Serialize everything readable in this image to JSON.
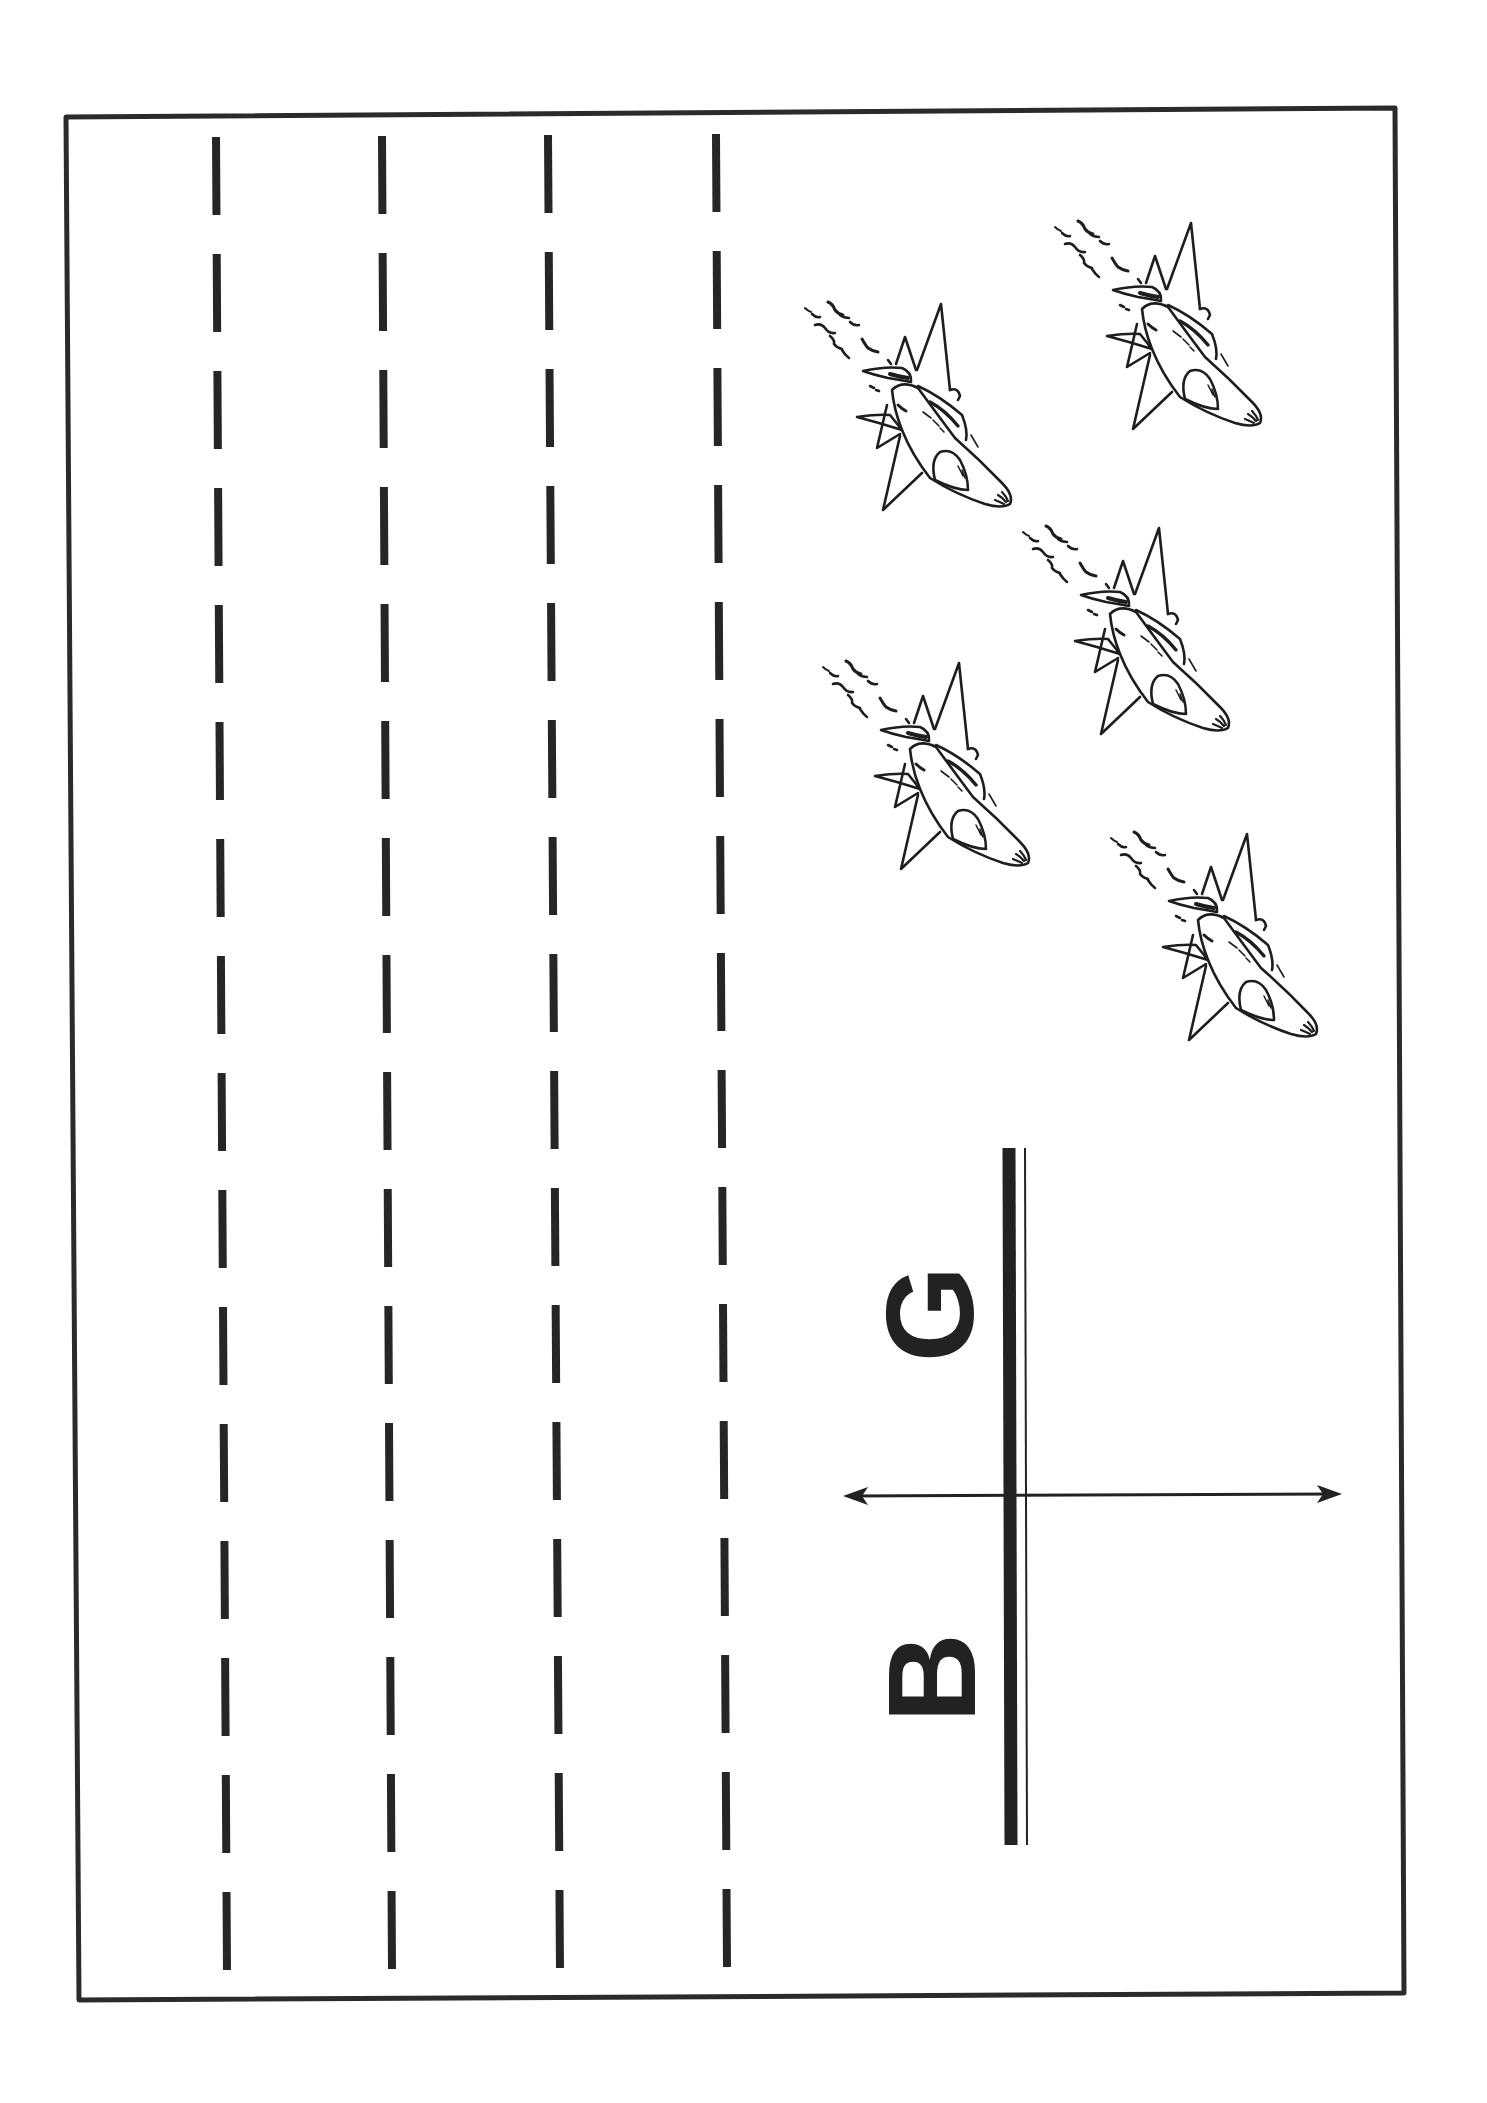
{
  "worksheet": {
    "type": "line-tracing worksheet",
    "orientation": "rotated 90deg (landscape content on portrait page)",
    "ink_color": "#222222",
    "background_color": "#ffffff"
  },
  "frame": {
    "corners": [
      [
        66,
        117
      ],
      [
        1395,
        108
      ],
      [
        1404,
        1993
      ],
      [
        79,
        2000
      ]
    ],
    "stroke_width": 5
  },
  "tracing_lines": {
    "count": 4,
    "dash_count_per_line": 16,
    "lines": [
      {
        "x_top": 216,
        "x_bottom": 227
      },
      {
        "x_top": 382,
        "x_bottom": 392
      },
      {
        "x_top": 548,
        "x_bottom": 560
      },
      {
        "x_top": 716,
        "x_bottom": 727
      }
    ]
  },
  "picture": {
    "subject": "fighter-jet formation",
    "count": 5,
    "planes": [
      {
        "name": "jet-1",
        "x": 790,
        "y": 290
      },
      {
        "name": "jet-2",
        "x": 1040,
        "y": 209
      },
      {
        "name": "jet-3",
        "x": 1008,
        "y": 514
      },
      {
        "name": "jet-4",
        "x": 808,
        "y": 649
      },
      {
        "name": "jet-5",
        "x": 1096,
        "y": 820
      }
    ]
  },
  "start_finish": {
    "start_letter": "G",
    "stop_letter": "B",
    "arrow": "double-headed arrow crossing double line"
  }
}
